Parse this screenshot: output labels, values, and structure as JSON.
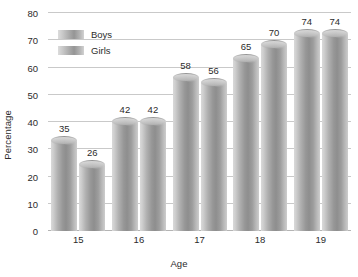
{
  "chart_data": {
    "type": "bar",
    "title": "",
    "xlabel": "Age",
    "ylabel": "Percentage",
    "categories": [
      "15",
      "16",
      "17",
      "18",
      "19"
    ],
    "series": [
      {
        "name": "Boys",
        "values": [
          35,
          42,
          58,
          65,
          74
        ]
      },
      {
        "name": "Girls",
        "values": [
          26,
          42,
          56,
          70,
          74
        ]
      }
    ],
    "ylim": [
      0,
      80
    ],
    "ytick_step": 10,
    "yticks": [
      "80",
      "70",
      "60",
      "50",
      "40",
      "30",
      "20",
      "10",
      "0"
    ],
    "grid": true,
    "legend_position": "top-left-inside",
    "data_labels": true,
    "bar_style": "cylinder",
    "colors": {
      "background": "#ffffff",
      "gridline": "#c9c9c9",
      "baseline": "#b4b4b4",
      "text": "#2b2b2b",
      "bar_light": "#d9d9d9",
      "bar_dark": "#8e8e8e"
    }
  },
  "axes": {
    "y_title": "Percentage",
    "x_title": "Age"
  },
  "legend": {
    "items": [
      {
        "label": "Boys"
      },
      {
        "label": "Girls"
      }
    ]
  }
}
